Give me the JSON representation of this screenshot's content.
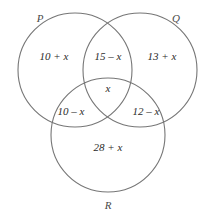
{
  "figure": {
    "type": "venn-diagram-3-set",
    "background_color": "#ffffff",
    "stroke_color": "#767676",
    "text_color": "#2b2b2b"
  },
  "sets": {
    "p_label": "P",
    "q_label": "Q",
    "r_label": "R"
  },
  "regions": {
    "p_only": "10 + x",
    "p_and_q_only": "15 – x",
    "q_only": "13 + x",
    "center_all_three": "x",
    "p_and_r_only": "10 – x",
    "q_and_r_only": "12 – x",
    "r_only": "28 + x"
  }
}
